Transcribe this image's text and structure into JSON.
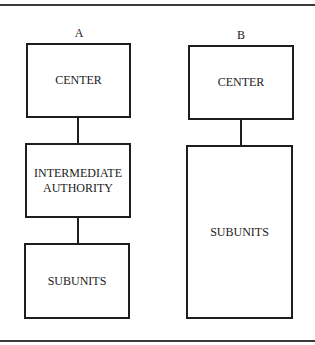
{
  "diagram": {
    "type": "organizational-structure-comparison",
    "columns": [
      {
        "label": "A",
        "boxes": [
          {
            "id": "a-center",
            "text": "CENTER"
          },
          {
            "id": "a-intermediate",
            "text": "INTERMEDIATE AUTHORITY"
          },
          {
            "id": "a-subunits",
            "text": "SUBUNITS"
          }
        ],
        "edges": [
          [
            "a-center",
            "a-intermediate"
          ],
          [
            "a-intermediate",
            "a-subunits"
          ]
        ]
      },
      {
        "label": "B",
        "boxes": [
          {
            "id": "b-center",
            "text": "CENTER"
          },
          {
            "id": "b-subunits",
            "text": "SUBUNITS"
          }
        ],
        "edges": [
          [
            "b-center",
            "b-subunits"
          ]
        ]
      }
    ]
  },
  "colors": {
    "line": "#1e1e1e",
    "rule": "#3a3a3a",
    "background": "#ffffff"
  }
}
